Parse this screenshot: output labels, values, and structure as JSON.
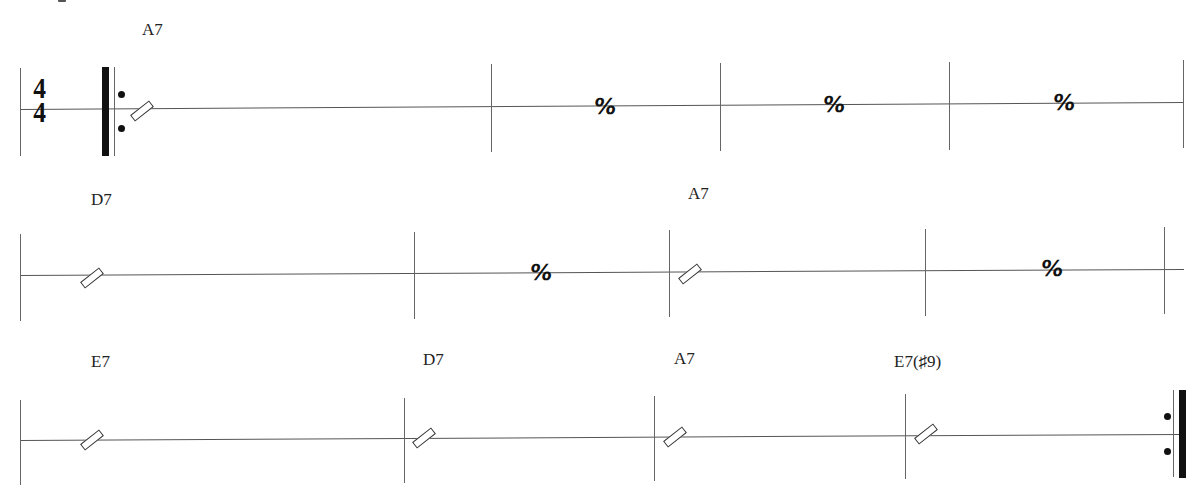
{
  "sheet": {
    "time_signature": {
      "top": "4",
      "bottom": "4"
    },
    "rows": [
      {
        "chords": [
          {
            "label": "A7",
            "measure": 1
          }
        ],
        "measures": [
          {
            "content": "slash"
          },
          {
            "content": "repeat",
            "symbol": "%"
          },
          {
            "content": "repeat",
            "symbol": "%"
          },
          {
            "content": "repeat",
            "symbol": "%"
          }
        ],
        "start": "repeat-start"
      },
      {
        "chords": [
          {
            "label": "D7",
            "measure": 1
          },
          {
            "label": "A7",
            "measure": 3
          }
        ],
        "measures": [
          {
            "content": "slash"
          },
          {
            "content": "repeat",
            "symbol": "%"
          },
          {
            "content": "slash"
          },
          {
            "content": "repeat",
            "symbol": "%"
          }
        ]
      },
      {
        "chords": [
          {
            "label": "E7",
            "measure": 1
          },
          {
            "label": "D7",
            "measure": 2
          },
          {
            "label": "A7",
            "measure": 3
          },
          {
            "label": "E7(♯9)",
            "measure": 4
          }
        ],
        "measures": [
          {
            "content": "slash"
          },
          {
            "content": "slash"
          },
          {
            "content": "slash"
          },
          {
            "content": "slash"
          }
        ],
        "end": "repeat-end"
      }
    ],
    "labels": {
      "r1c1": "A7",
      "r2c1": "D7",
      "r2c3": "A7",
      "r3c1": "E7",
      "r3c2": "D7",
      "r3c3": "A7",
      "r3c4": "E7(♯9)",
      "repeat_symbol": "%",
      "ts_top": "4",
      "ts_bottom": "4"
    }
  }
}
